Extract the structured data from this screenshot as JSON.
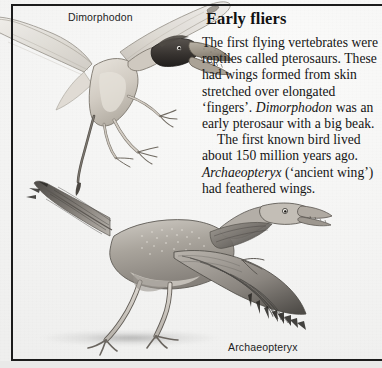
{
  "page": {
    "background_color": "#f7f7f6",
    "rule_color": "#1c1c1c",
    "footer_strip_color": "#e9e9e8"
  },
  "article": {
    "heading": "Early fliers",
    "paragraphs": [
      {
        "id": "p1",
        "runs": [
          {
            "text": "The first flying vertebrates were reptiles called pterosaurs. These had wings formed from skin stretched over elongated ‘fingers’. ",
            "style": "roman"
          },
          {
            "text": "Dimorphodon",
            "style": "italic"
          },
          {
            "text": " was an early pterosaur with a big beak.",
            "style": "roman"
          }
        ]
      },
      {
        "id": "p2",
        "indent": true,
        "runs": [
          {
            "text": "The first known bird lived about 150 million years ago. ",
            "style": "roman"
          },
          {
            "text": "Archaeopteryx",
            "style": "italic"
          },
          {
            "text": " (‘ancient wing’) had feathered wings.",
            "style": "roman"
          }
        ]
      }
    ]
  },
  "figures": [
    {
      "id": "pterosaur",
      "label": "Dimorphodon",
      "description": "Pterosaur in flight with membrane wings and large beak",
      "colors": {
        "wing_membrane": "#dfdcd6",
        "body": "#cfcac2",
        "head_dark": "#3c3a38",
        "outline": "#6a6560"
      }
    },
    {
      "id": "archaeopteryx",
      "label": "Archaeopteryx",
      "description": "Feathered bird-like dinosaur standing with wings spread",
      "colors": {
        "body": "#a9a49c",
        "feather_dark": "#4a4744",
        "feather_mid": "#8b8680",
        "legs": "#cdc8c1",
        "outline": "#59554f"
      }
    }
  ]
}
